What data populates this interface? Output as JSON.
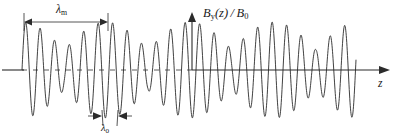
{
  "figure": {
    "type": "physics-waveform-diagram",
    "background_color": "#ffffff",
    "ink_color": "#2b2b2b"
  },
  "labels": {
    "lambda_m": "λ",
    "lambda_m_sub": "m",
    "lambda_0": "λ",
    "lambda_0_sub": "0",
    "y_axis": "B",
    "y_axis_sub": "y",
    "y_axis_rest": "(z) / B",
    "y_axis_rest_sub": "0",
    "z_axis": "z"
  },
  "annotations": {
    "lambda_m_span": {
      "x_start": 24,
      "x_end": 108,
      "y": 22,
      "description": "modulation wavelength double arrow"
    },
    "lambda_0_span": {
      "x_start": 95,
      "x_end": 125,
      "y": 118,
      "description": "carrier wavelength inward arrows"
    }
  },
  "chart_data": {
    "type": "line",
    "title": "",
    "xlabel": "z",
    "ylabel": "B_y(z) / B_0",
    "grid": false,
    "legend": null,
    "axes": {
      "baseline_y_px": 70,
      "y_axis_x_px": 192,
      "x_start_px": 22,
      "x_end_px": 356,
      "z_arrow_end_px": 388,
      "y_arrow_top_px": 13,
      "baseline_dashed_left_of_y_axis": true,
      "baseline_solid_right_of_y_axis": true
    },
    "model": {
      "carrier_wavelength_px": 14.5,
      "modulation_wavelength_px": 84,
      "envelope_min_ratio": 0.42,
      "amplitude_px": 48,
      "carrier_phase_deg": 0,
      "modulation_phase_deg": 0
    },
    "x": [
      22,
      50,
      78,
      106,
      134,
      162,
      190,
      218,
      246,
      274,
      302,
      330,
      356
    ],
    "envelope": [
      1.0,
      0.55,
      0.72,
      1.0,
      0.55,
      0.72,
      1.0,
      0.55,
      0.72,
      1.0,
      0.55,
      0.72,
      1.0
    ],
    "xlim": [
      0,
      394
    ],
    "ylim": [
      -1,
      1
    ]
  }
}
